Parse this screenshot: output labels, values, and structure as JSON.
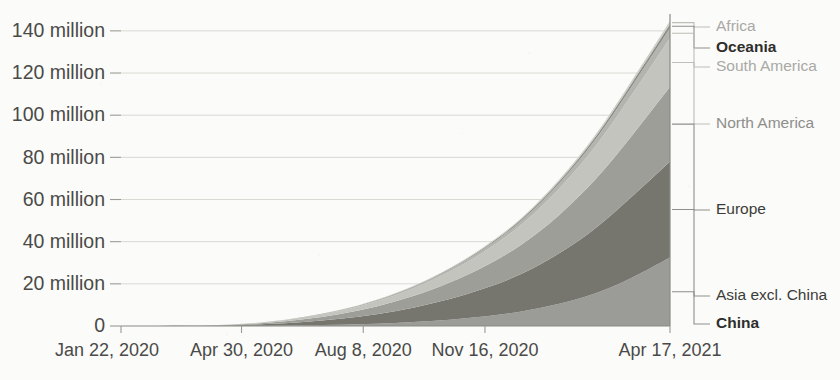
{
  "chart_data": {
    "type": "area",
    "stacked": true,
    "title": "",
    "subtitle": "",
    "xlabel": "",
    "ylabel": "",
    "ylim": [
      0,
      148000000
    ],
    "ytick_values": [
      0,
      20000000,
      40000000,
      60000000,
      80000000,
      100000000,
      120000000,
      140000000
    ],
    "ytick_labels": [
      "0",
      "20 million",
      "40 million",
      "60 million",
      "80 million",
      "100 million",
      "120 million",
      "140 million"
    ],
    "xtick_labels": [
      "Jan 22, 2020",
      "Apr 30, 2020",
      "Aug 8, 2020",
      "Nov 16, 2020",
      "Apr 17, 2021"
    ],
    "xtick_positions_days": [
      0,
      99,
      199,
      299,
      451
    ],
    "x_range_days": [
      0,
      451
    ],
    "grid": true,
    "legend_position": "right-outside-labels",
    "x": [
      0,
      30,
      60,
      90,
      120,
      150,
      180,
      210,
      240,
      270,
      300,
      330,
      360,
      390,
      420,
      451
    ],
    "series": [
      {
        "name": "China",
        "color": "#9b9b98",
        "values": [
          0,
          0,
          10000,
          60000,
          150000,
          300000,
          600000,
          1100000,
          1900000,
          3000000,
          4600000,
          7000000,
          10500000,
          15500000,
          23000000,
          32500000
        ]
      },
      {
        "name": "Asia excl. China",
        "color": "#76766f",
        "values": [
          0,
          10000,
          60000,
          300000,
          800000,
          1600000,
          2800000,
          4500000,
          6800000,
          9800000,
          13500000,
          18000000,
          24000000,
          31000000,
          38500000,
          45500000
        ]
      },
      {
        "name": "Europe",
        "color": "#9e9e99",
        "values": [
          0,
          5000,
          40000,
          200000,
          600000,
          1300000,
          2300000,
          3700000,
          5500000,
          7800000,
          10600000,
          14000000,
          18200000,
          23200000,
          29000000,
          35500000
        ]
      },
      {
        "name": "North America",
        "color": "#c4c4bf",
        "values": [
          0,
          2000,
          20000,
          120000,
          380000,
          850000,
          1500000,
          2400000,
          3600000,
          5200000,
          7200000,
          9600000,
          12500000,
          15800000,
          19500000,
          23000000
        ]
      },
      {
        "name": "South America",
        "color": "#b4b4af",
        "values": [
          0,
          0,
          2000,
          15000,
          60000,
          150000,
          280000,
          460000,
          700000,
          1000000,
          1400000,
          1900000,
          2500000,
          3200000,
          4000000,
          4800000
        ]
      },
      {
        "name": "Oceania",
        "color": "#8d8d88",
        "values": [
          0,
          0,
          1000,
          6000,
          20000,
          50000,
          95000,
          160000,
          250000,
          370000,
          520000,
          700000,
          920000,
          1180000,
          1480000,
          1800000
        ]
      },
      {
        "name": "Africa",
        "color": "#cdcdc8",
        "values": [
          0,
          0,
          1000,
          5000,
          18000,
          45000,
          85000,
          145000,
          225000,
          330000,
          465000,
          630000,
          830000,
          1060000,
          1330000,
          1600000
        ]
      }
    ]
  },
  "legend": {
    "items": [
      {
        "label": "Africa",
        "style": "dim"
      },
      {
        "label": "Oceania",
        "style": "bold"
      },
      {
        "label": "South America",
        "style": "dim"
      },
      {
        "label": "North America",
        "style": "mid"
      },
      {
        "label": "Europe",
        "style": "dark"
      },
      {
        "label": "Asia excl. China",
        "style": "dark"
      },
      {
        "label": "China",
        "style": "bold"
      }
    ]
  },
  "axis": {
    "y_labels": [
      "140 million",
      "120 million",
      "100 million",
      "80 million",
      "60 million",
      "40 million",
      "20 million",
      "0"
    ],
    "x_labels": [
      "Jan 22, 2020",
      "Apr 30, 2020",
      "Aug 8, 2020",
      "Nov 16, 2020",
      "Apr 17, 2021"
    ]
  }
}
